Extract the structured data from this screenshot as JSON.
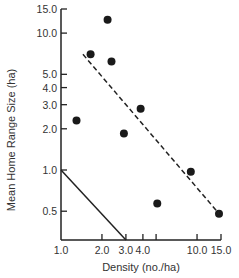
{
  "chart_data": {
    "type": "scatter",
    "title": "",
    "xlabel": "Density (no./ha)",
    "ylabel": "Mean Home Range Size (ha)",
    "xscale": "log",
    "yscale": "log",
    "xlim": [
      1.0,
      15.0
    ],
    "ylim": [
      0.3,
      15.0
    ],
    "x_ticks": [
      1.0,
      2.0,
      3.0,
      4.0,
      5.0,
      10.0,
      15.0
    ],
    "x_tick_labels": [
      "1.0",
      "2.0",
      "3.0",
      "4.0",
      "",
      "10.0",
      "15.0"
    ],
    "y_ticks": [
      0.5,
      1.0,
      2.0,
      3.0,
      4.0,
      5.0,
      10.0,
      15.0
    ],
    "y_tick_labels": [
      "0.5",
      "1.0",
      "2.0",
      "3.0",
      "4.0",
      "5.0",
      "10.0",
      "15.0"
    ],
    "grid": false,
    "series": [
      {
        "name": "Observed",
        "style": "points",
        "points": [
          {
            "x": 1.3,
            "y": 2.3
          },
          {
            "x": 1.65,
            "y": 7.0
          },
          {
            "x": 2.2,
            "y": 12.5
          },
          {
            "x": 2.35,
            "y": 6.2
          },
          {
            "x": 2.9,
            "y": 1.85
          },
          {
            "x": 3.85,
            "y": 2.8
          },
          {
            "x": 5.1,
            "y": 0.57
          },
          {
            "x": 9.0,
            "y": 0.97
          },
          {
            "x": 14.5,
            "y": 0.48
          }
        ]
      },
      {
        "name": "Fitted regression",
        "style": "dashed-line",
        "points": [
          {
            "x": 1.45,
            "y": 7.0
          },
          {
            "x": 14.5,
            "y": 0.48
          }
        ]
      },
      {
        "name": "Reference line",
        "style": "solid-line",
        "points": [
          {
            "x": 1.0,
            "y": 1.0
          },
          {
            "x": 3.0,
            "y": 0.3
          }
        ]
      }
    ]
  }
}
